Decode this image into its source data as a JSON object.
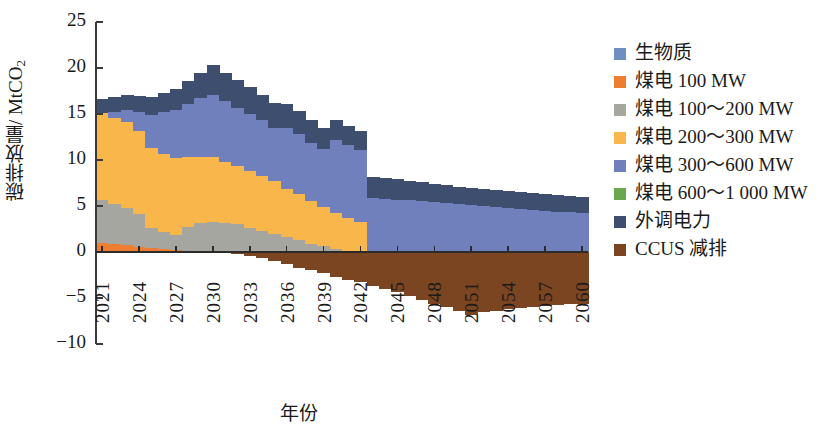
{
  "chart_data": {
    "type": "bar",
    "stacked": true,
    "title": "",
    "xlabel": "年份",
    "ylabel": "碳排放量/ MtCO2",
    "ylabel_parts": {
      "main": "碳排放量/ MtCO",
      "sub": "2"
    },
    "ylim": [
      -10,
      25
    ],
    "yticks": [
      25,
      20,
      15,
      10,
      5,
      0,
      -5,
      -10
    ],
    "ytick_labels": [
      "25",
      "20",
      "15",
      "10",
      "5",
      "0",
      "−5",
      "−10"
    ],
    "grid": false,
    "legend_position": "right",
    "x_start": 2021,
    "x_end": 2060,
    "x_tick_step": 3,
    "xtick_labels": [
      "2021",
      "2024",
      "2027",
      "2030",
      "2033",
      "2036",
      "2039",
      "2042",
      "2045",
      "2048",
      "2051",
      "2054",
      "2057",
      "2060"
    ],
    "x": [
      2021,
      2022,
      2023,
      2024,
      2025,
      2026,
      2027,
      2028,
      2029,
      2030,
      2031,
      2032,
      2033,
      2034,
      2035,
      2036,
      2037,
      2038,
      2039,
      2040,
      2041,
      2042,
      2043,
      2044,
      2045,
      2046,
      2047,
      2048,
      2049,
      2050,
      2051,
      2052,
      2053,
      2054,
      2055,
      2056,
      2057,
      2058,
      2059,
      2060
    ],
    "series": [
      {
        "name": "生物质",
        "color": "#6f8fc0",
        "values": [
          0,
          0,
          0,
          0,
          0,
          0,
          0,
          0,
          0,
          0,
          0,
          0,
          0,
          0,
          0,
          0,
          0,
          0,
          0,
          0,
          0,
          0,
          0,
          0,
          0,
          0,
          0,
          0,
          0,
          0,
          0,
          0,
          0,
          0,
          0,
          0,
          0,
          0,
          0,
          0
        ]
      },
      {
        "name": "煤电 100 MW",
        "color": "#ed7d31",
        "values": [
          1.0,
          0.9,
          0.8,
          0.5,
          0.4,
          0.3,
          0.2,
          0.1,
          0.1,
          0.0,
          0.0,
          0.0,
          0.0,
          0.0,
          0.0,
          0.0,
          0.0,
          0.0,
          0.0,
          0.0,
          0.0,
          0.0,
          0.0,
          0.0,
          0.0,
          0.0,
          0.0,
          0.0,
          0.0,
          0.0,
          0.0,
          0.0,
          0.0,
          0.0,
          0.0,
          0.0,
          0.0,
          0.0,
          0.0,
          0.0
        ]
      },
      {
        "name": "煤电 100～200 MW",
        "color": "#a6a6a0",
        "values": [
          4.6,
          4.3,
          4.0,
          3.6,
          2.2,
          1.9,
          1.7,
          2.6,
          3.0,
          3.3,
          3.2,
          3.0,
          2.6,
          2.3,
          2.0,
          1.6,
          1.3,
          0.9,
          0.6,
          0.3,
          0.1,
          0.0,
          0.0,
          0.0,
          0.0,
          0.0,
          0.0,
          0.0,
          0.0,
          0.0,
          0.0,
          0.0,
          0.0,
          0.0,
          0.0,
          0.0,
          0.0,
          0.0,
          0.0,
          0.0
        ]
      },
      {
        "name": "煤电 200～300 MW",
        "color": "#f9b64a",
        "values": [
          9.5,
          9.4,
          9.3,
          9.1,
          8.7,
          8.5,
          8.3,
          7.6,
          7.2,
          7.0,
          6.6,
          6.3,
          6.2,
          6.0,
          5.7,
          5.3,
          5.0,
          4.6,
          4.3,
          3.9,
          3.6,
          3.3,
          0.0,
          0.0,
          0.0,
          0.0,
          0.0,
          0.0,
          0.0,
          0.0,
          0.0,
          0.0,
          0.0,
          0.0,
          0.0,
          0.0,
          0.0,
          0.0,
          0.0,
          0.0
        ]
      },
      {
        "name": "煤电 300～600 MW",
        "color": "#6f80bd",
        "values": [
          0.0,
          0.6,
          1.3,
          2.0,
          3.6,
          4.5,
          5.2,
          5.8,
          6.4,
          6.8,
          6.6,
          6.4,
          6.2,
          6.0,
          5.8,
          6.6,
          6.5,
          6.4,
          6.3,
          8.0,
          7.9,
          7.8,
          5.9,
          5.8,
          5.7,
          5.6,
          5.5,
          5.4,
          5.3,
          5.2,
          5.1,
          5.0,
          4.9,
          4.8,
          4.7,
          4.6,
          4.5,
          4.4,
          4.3,
          4.2
        ]
      },
      {
        "name": "煤电 600～1 000 MW",
        "color": "#6aa84f",
        "values": [
          0,
          0,
          0,
          0,
          0,
          0,
          0,
          0,
          0,
          0,
          0,
          0,
          0,
          0,
          0,
          0,
          0,
          0,
          0,
          0,
          0,
          0,
          0,
          0,
          0,
          0,
          0,
          0,
          0,
          0,
          0,
          0,
          0,
          0,
          0,
          0,
          0,
          0,
          0,
          0
        ]
      },
      {
        "name": "外调电力",
        "color": "#3e4e6e",
        "values": [
          1.5,
          1.6,
          1.7,
          1.8,
          2.0,
          2.1,
          2.3,
          2.5,
          2.8,
          3.2,
          3.1,
          3.0,
          2.9,
          2.8,
          2.7,
          2.6,
          2.5,
          2.4,
          2.3,
          2.2,
          2.1,
          2.0,
          2.3,
          2.2,
          2.2,
          2.1,
          2.1,
          2.0,
          2.0,
          1.9,
          1.9,
          1.9,
          1.8,
          1.8,
          1.8,
          1.8,
          1.8,
          1.8,
          1.8,
          1.8
        ]
      },
      {
        "name": "CCUS 减排",
        "color": "#7b4521",
        "values": [
          0.0,
          0.0,
          0.0,
          0.0,
          0.0,
          0.0,
          0.0,
          0.0,
          0.0,
          0.0,
          0.0,
          -0.2,
          -0.4,
          -0.7,
          -1.0,
          -1.3,
          -1.7,
          -2.0,
          -2.3,
          -2.7,
          -3.0,
          -3.3,
          -3.7,
          -4.0,
          -4.4,
          -4.8,
          -5.2,
          -5.6,
          -6.0,
          -6.4,
          -6.8,
          -6.5,
          -6.4,
          -6.2,
          -6.1,
          -6.0,
          -5.9,
          -5.8,
          -5.7,
          -5.7
        ]
      }
    ]
  },
  "legend": {
    "items": [
      {
        "label": "生物质",
        "color": "#6f8fc0"
      },
      {
        "label": "煤电  100 MW",
        "color": "#ed7d31"
      },
      {
        "label": "煤电  100～200 MW",
        "color": "#a6a6a0"
      },
      {
        "label": "煤电  200～300 MW",
        "color": "#f9b64a"
      },
      {
        "label": "煤电  300～600 MW",
        "color": "#6f80bd"
      },
      {
        "label": "煤电  600～1 000 MW",
        "color": "#6aa84f"
      },
      {
        "label": "外调电力",
        "color": "#3e4e6e"
      },
      {
        "label": "CCUS 减排",
        "color": "#7b4521"
      }
    ]
  },
  "axis": {
    "y_title_main": "碳排放量/ MtCO",
    "y_title_sub": "2",
    "x_title": "年份"
  }
}
